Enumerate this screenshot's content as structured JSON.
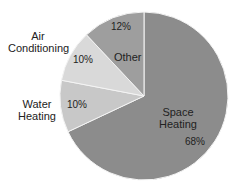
{
  "chart_data": {
    "type": "pie",
    "title": "",
    "start_angle_deg": 0,
    "direction": "clockwise",
    "slices": [
      {
        "label": "Space Heating",
        "label_lines": [
          "Space",
          "Heating"
        ],
        "value": 68,
        "value_label": "68%",
        "color": "#8c8c8c"
      },
      {
        "label": "Water Heating",
        "label_lines": [
          "Water",
          "Heating"
        ],
        "value": 10,
        "value_label": "10%",
        "color": "#c8c8c8"
      },
      {
        "label": "Air Conditioning",
        "label_lines": [
          "Air",
          "Conditioning"
        ],
        "value": 10,
        "value_label": "10%",
        "color": "#d9d9d9"
      },
      {
        "label": "Other",
        "label_lines": [
          "Other"
        ],
        "value": 12,
        "value_label": "12%",
        "color": "#9e9e9e"
      }
    ],
    "legend": "none"
  }
}
